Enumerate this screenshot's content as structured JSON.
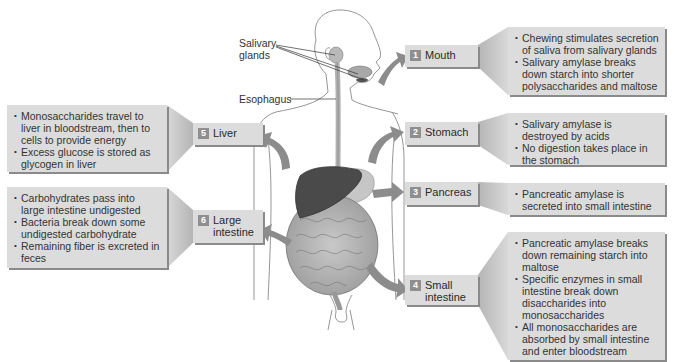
{
  "diagram": {
    "anatomy_labels": {
      "salivary_glands": "Salivary glands",
      "esophagus": "Esophagus"
    },
    "stages": [
      {
        "number": "1",
        "organ": "Mouth",
        "points": [
          "Chewing stimulates secretion of saliva from salivary glands",
          "Salivary amylase breaks down starch into shorter polysaccharides and maltose"
        ]
      },
      {
        "number": "2",
        "organ": "Stomach",
        "points": [
          "Salivary amylase is destroyed by acids",
          "No digestion takes place in the stomach"
        ]
      },
      {
        "number": "3",
        "organ": "Pancreas",
        "points": [
          "Pancreatic amylase is secreted into small intestine"
        ]
      },
      {
        "number": "4",
        "organ": "Small intestine",
        "points": [
          "Pancreatic amylase breaks down remaining starch into maltose",
          "Specific enzymes in small intestine break down disaccharides into monosaccharides",
          "All monosaccharides are absorbed by small intestine and enter bloodstream"
        ]
      },
      {
        "number": "5",
        "organ": "Liver",
        "points": [
          "Monosaccharides travel to liver in bloodstream, then to cells to provide energy",
          "Excess glucose is stored as glycogen in liver"
        ]
      },
      {
        "number": "6",
        "organ": "Large intestine",
        "points": [
          "Carbohydrates pass into large intestine undigested",
          "Bacteria break down some undigested carbohydrate",
          "Remaining fiber is excreted in feces"
        ]
      }
    ],
    "colors": {
      "box_fill": "#dcdcdc",
      "box_shadow": "#8a8a8a",
      "number_badge": "#8f8f8f",
      "arrow": "#8c8c8c",
      "liver": "#4a4a4a"
    }
  }
}
